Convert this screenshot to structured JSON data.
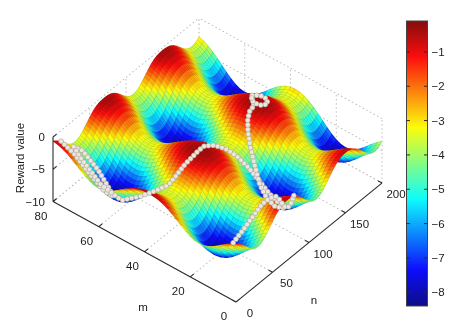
{
  "chart_data": {
    "type": "surface3d",
    "title": "",
    "axes": {
      "m": {
        "label": "m",
        "ticks": [
          0,
          20,
          40,
          60,
          80
        ],
        "range": [
          0,
          80
        ]
      },
      "n": {
        "label": "n",
        "ticks": [
          0,
          50,
          100,
          150,
          200
        ],
        "range": [
          0,
          200
        ]
      },
      "z": {
        "label": "Reward value",
        "ticks": [
          0,
          -5,
          -10
        ],
        "range": [
          -10,
          0
        ]
      }
    },
    "colorbar": {
      "ticks": [
        -1,
        -2,
        -3,
        -4,
        -5,
        -6,
        -7,
        -8
      ],
      "value_range": [
        -8.4,
        -0.1
      ],
      "colormap": "jet"
    },
    "surface": {
      "description": "periodic reward landscape: broad high ridges near -0.5, narrow deep pits near -8.4",
      "z_max": -0.4,
      "amplitude": 8,
      "exponent": 1.4,
      "m_period": 44,
      "m_phase": 38,
      "n_period": 80,
      "n_phase": -10,
      "grid_m": 41,
      "grid_n": 81
    },
    "trajectory": {
      "marker": "dot",
      "color": "#ece7de",
      "edge_color": "#b9b3a6",
      "segments": [
        [
          [
            79,
            8
          ],
          [
            74,
            10
          ],
          [
            68,
            13
          ],
          [
            63,
            17
          ],
          [
            61,
            23
          ],
          [
            64,
            28
          ],
          [
            70,
            30
          ],
          [
            76,
            28
          ],
          [
            78,
            22
          ],
          [
            74,
            18
          ],
          [
            66,
            22
          ],
          [
            58,
            25
          ],
          [
            50,
            26
          ],
          [
            44,
            29
          ],
          [
            41,
            36
          ],
          [
            40,
            44
          ],
          [
            39,
            52
          ],
          [
            38,
            60
          ],
          [
            38,
            68
          ],
          [
            38,
            76
          ],
          [
            37,
            84
          ],
          [
            37,
            92
          ],
          [
            37,
            100
          ],
          [
            36,
            102
          ],
          [
            33,
            105
          ],
          [
            29,
            108
          ],
          [
            25,
            110
          ],
          [
            21,
            111
          ],
          [
            17,
            111
          ],
          [
            14,
            109
          ],
          [
            13,
            105
          ],
          [
            16,
            103
          ],
          [
            20,
            105
          ],
          [
            24,
            108
          ],
          [
            28,
            114
          ],
          [
            32,
            120
          ],
          [
            35,
            126
          ],
          [
            37,
            132
          ],
          [
            38,
            138
          ],
          [
            38,
            144
          ],
          [
            40,
            148
          ],
          [
            42,
            153
          ],
          [
            40,
            158
          ],
          [
            37,
            158
          ],
          [
            35,
            153
          ],
          [
            36,
            148
          ],
          [
            39,
            146
          ],
          [
            41,
            150
          ]
        ],
        [
          [
            14,
            40
          ],
          [
            12,
            48
          ],
          [
            10,
            56
          ],
          [
            9,
            64
          ],
          [
            8,
            72
          ],
          [
            8,
            80
          ],
          [
            9,
            88
          ],
          [
            10,
            96
          ],
          [
            11,
            104
          ],
          [
            12,
            112
          ],
          [
            13,
            120
          ]
        ]
      ]
    },
    "colors": {
      "axis": "#2a2a2a",
      "grid": "#b5b5b5",
      "background": "#ffffff",
      "colorbar_border": "#444444"
    }
  }
}
